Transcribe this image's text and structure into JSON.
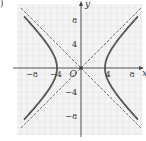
{
  "figure": {
    "corner_label": ")",
    "origin_label": "O",
    "x_axis_label": "x",
    "y_axis_label": "y"
  },
  "chart_data": {
    "type": "line",
    "title": "",
    "xlabel": "x",
    "ylabel": "y",
    "xlim": [
      -11,
      10.5
    ],
    "ylim": [
      -11.5,
      11
    ],
    "grid": true,
    "x_ticks": [
      -8,
      -4,
      4,
      8
    ],
    "x_tick_labels": [
      "−8",
      "−4",
      "4",
      "8"
    ],
    "y_ticks": [
      8,
      4,
      -4,
      -8
    ],
    "y_tick_labels": [
      "8",
      "4",
      "−4",
      "−8"
    ],
    "origin_label": "O",
    "series": [
      {
        "name": "hyperbola",
        "equation": "x^2 - y^2 = 16",
        "style": "solid-thick",
        "color": "#555555",
        "branches": [
          {
            "side": "right",
            "points": [
              [
                9.5,
                8.6
              ],
              [
                7,
                5.74
              ],
              [
                5.5,
                3.77
              ],
              [
                4.5,
                2.06
              ],
              [
                4,
                0
              ],
              [
                4.5,
                -2.06
              ],
              [
                5.5,
                -3.77
              ],
              [
                7,
                -5.74
              ],
              [
                9.5,
                -8.6
              ]
            ]
          },
          {
            "side": "left",
            "points": [
              [
                -9.5,
                8.6
              ],
              [
                -7,
                5.74
              ],
              [
                -5.5,
                3.77
              ],
              [
                -4.5,
                2.06
              ],
              [
                -4,
                0
              ],
              [
                -4.5,
                -2.06
              ],
              [
                -5.5,
                -3.77
              ],
              [
                -7,
                -5.74
              ],
              [
                -9.5,
                -8.6
              ]
            ]
          }
        ]
      },
      {
        "name": "asymptote y = x",
        "style": "dashed",
        "color": "#555555",
        "points": [
          [
            -10,
            -10
          ],
          [
            10,
            10
          ]
        ]
      },
      {
        "name": "asymptote y = -x",
        "style": "dashed",
        "color": "#555555",
        "points": [
          [
            -10,
            10
          ],
          [
            10,
            -10
          ]
        ]
      }
    ],
    "vertices": [
      [
        -4,
        0
      ],
      [
        4,
        0
      ]
    ]
  }
}
